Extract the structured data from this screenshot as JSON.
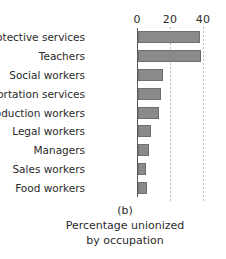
{
  "chart_data": {
    "type": "bar",
    "orientation": "horizontal",
    "title": "",
    "panel_label": "(b)",
    "caption_lines": [
      "Percentage unionized",
      "by occupation"
    ],
    "xlabel": "",
    "ylabel": "",
    "xlim": [
      0,
      45
    ],
    "xticks": [
      0,
      20,
      40
    ],
    "xtick_labels": [
      "0",
      "20",
      "40"
    ],
    "grid": "vertical-dotted",
    "legend": "none",
    "bar_color": "#8a8a8a",
    "bar_edge_color": "#6f6f6f",
    "axis_color": "#5a5a5a",
    "gridline_color": "#b9b9b9",
    "categories": [
      "Protective services",
      "Teachers",
      "Social workers",
      "Transportation services",
      "Production workers",
      "Legal workers",
      "Managers",
      "Sales workers",
      "Food workers"
    ],
    "values": [
      37.5,
      38,
      15,
      14,
      13,
      8,
      6.5,
      5,
      5.5
    ]
  }
}
